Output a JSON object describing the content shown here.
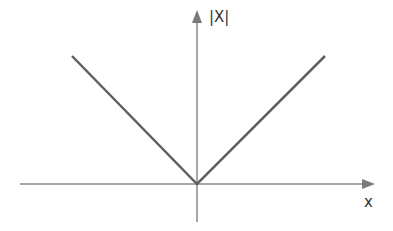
{
  "diagram": {
    "y_axis_label": "|X|",
    "x_axis_label": "x",
    "function": "y = |x|",
    "colors": {
      "axis": "#8a8a8a",
      "curve": "#606060",
      "text": "#333333"
    }
  }
}
